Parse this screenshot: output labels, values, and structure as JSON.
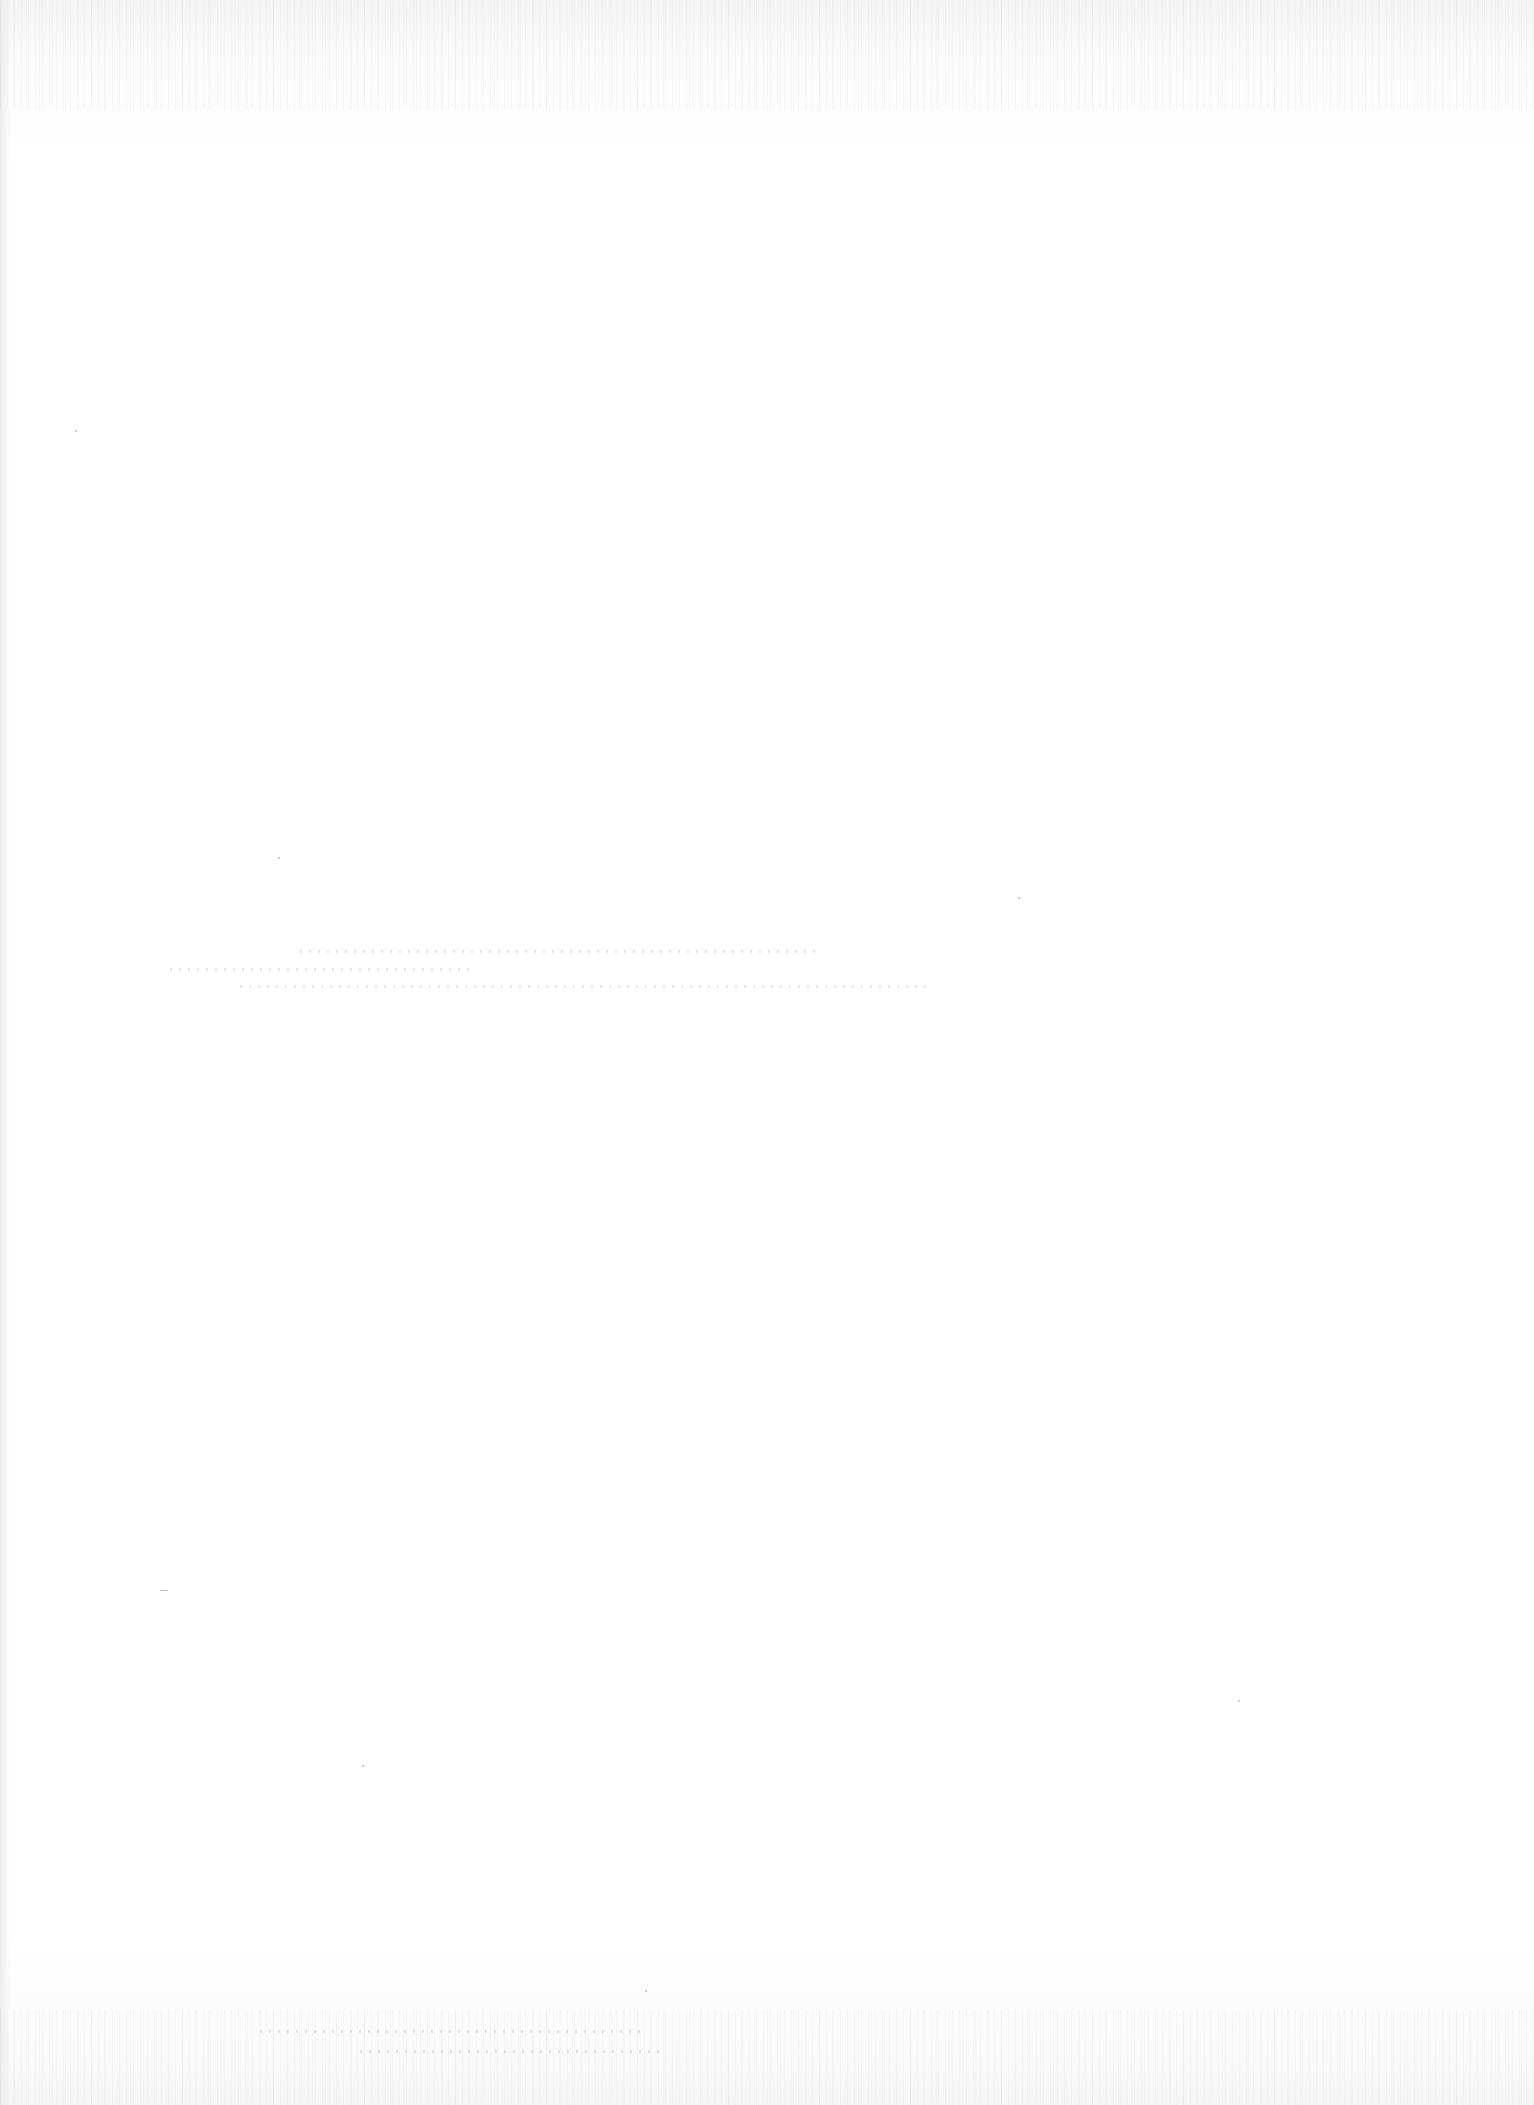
{
  "page": {
    "type": "blank-scanned-page",
    "background_color": "#ffffff",
    "visible_text": []
  }
}
